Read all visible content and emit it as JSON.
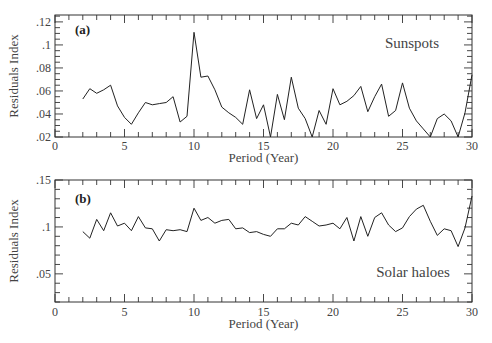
{
  "chart_data": [
    {
      "type": "line",
      "panel_tag": "(a)",
      "series_label": "Sunspots",
      "xlabel": "Period (Year)",
      "ylabel": "Residuals Index",
      "xlim": [
        0,
        30
      ],
      "ylim": [
        0.02,
        0.126
      ],
      "xticks": [
        0,
        5,
        10,
        15,
        20,
        25,
        30
      ],
      "xtick_labels": [
        "0",
        "5",
        "10",
        "15",
        "20",
        "25",
        "30"
      ],
      "yticks": [
        0.02,
        0.04,
        0.06,
        0.08,
        0.1,
        0.12
      ],
      "ytick_labels": [
        ".02",
        ".04",
        ".06",
        ".08",
        ".1",
        ".12"
      ],
      "grid": false,
      "x": [
        2,
        2.5,
        3,
        3.5,
        4,
        4.5,
        5,
        5.5,
        6,
        6.5,
        7,
        7.5,
        8,
        8.5,
        9,
        9.5,
        10,
        10.5,
        11,
        11.5,
        12,
        12.5,
        13,
        13.5,
        14,
        14.5,
        15,
        15.5,
        16,
        16.5,
        17,
        17.5,
        18,
        18.5,
        19,
        19.5,
        20,
        20.5,
        21,
        21.5,
        22,
        22.5,
        23,
        23.5,
        24,
        24.5,
        25,
        25.5,
        26,
        26.5,
        27,
        27.5,
        28,
        28.5,
        29,
        29.5,
        30
      ],
      "values": [
        0.053,
        0.062,
        0.058,
        0.061,
        0.065,
        0.047,
        0.037,
        0.031,
        0.041,
        0.05,
        0.048,
        0.049,
        0.05,
        0.055,
        0.033,
        0.038,
        0.111,
        0.072,
        0.073,
        0.061,
        0.046,
        0.041,
        0.037,
        0.031,
        0.061,
        0.036,
        0.048,
        0.02,
        0.057,
        0.035,
        0.072,
        0.045,
        0.036,
        0.02,
        0.043,
        0.031,
        0.062,
        0.048,
        0.051,
        0.056,
        0.064,
        0.042,
        0.055,
        0.066,
        0.038,
        0.043,
        0.067,
        0.045,
        0.034,
        0.027,
        0.02,
        0.036,
        0.04,
        0.034,
        0.02,
        0.041,
        0.074
      ]
    },
    {
      "type": "line",
      "panel_tag": "(b)",
      "series_label": "Solar haloes",
      "xlabel": "Period (Year)",
      "ylabel": "Residuals Index",
      "xlim": [
        0,
        30
      ],
      "ylim": [
        0.02,
        0.15
      ],
      "xticks": [
        0,
        5,
        10,
        15,
        20,
        25,
        30
      ],
      "xtick_labels": [
        "0",
        "5",
        "10",
        "15",
        "20",
        "25",
        "30"
      ],
      "yticks": [
        0.05,
        0.1,
        0.15
      ],
      "ytick_labels": [
        ".05",
        ".1",
        ".15"
      ],
      "grid": false,
      "x": [
        2,
        2.5,
        3,
        3.5,
        4,
        4.5,
        5,
        5.5,
        6,
        6.5,
        7,
        7.5,
        8,
        8.5,
        9,
        9.5,
        10,
        10.5,
        11,
        11.5,
        12,
        12.5,
        13,
        13.5,
        14,
        14.5,
        15,
        15.5,
        16,
        16.5,
        17,
        17.5,
        18,
        18.5,
        19,
        19.5,
        20,
        20.5,
        21,
        21.5,
        22,
        22.5,
        23,
        23.5,
        24,
        24.5,
        25,
        25.5,
        26,
        26.5,
        27,
        27.5,
        28,
        28.5,
        29,
        29.5,
        30
      ],
      "values": [
        0.095,
        0.088,
        0.108,
        0.096,
        0.115,
        0.101,
        0.104,
        0.096,
        0.111,
        0.099,
        0.098,
        0.085,
        0.097,
        0.096,
        0.097,
        0.095,
        0.12,
        0.107,
        0.11,
        0.104,
        0.107,
        0.108,
        0.098,
        0.099,
        0.094,
        0.095,
        0.092,
        0.09,
        0.098,
        0.098,
        0.104,
        0.102,
        0.111,
        0.106,
        0.101,
        0.102,
        0.104,
        0.098,
        0.11,
        0.085,
        0.111,
        0.09,
        0.11,
        0.115,
        0.102,
        0.095,
        0.099,
        0.111,
        0.119,
        0.123,
        0.106,
        0.091,
        0.098,
        0.096,
        0.079,
        0.099,
        0.133
      ]
    }
  ]
}
